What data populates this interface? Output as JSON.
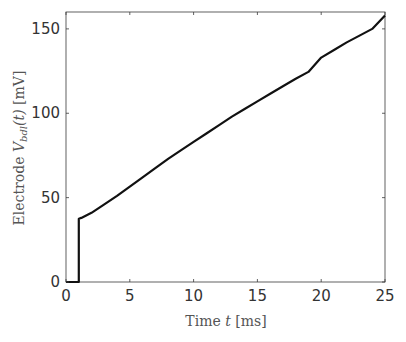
{
  "chart_data": {
    "type": "line",
    "title": "",
    "xlabel": "Time t [ms]",
    "xlabel_parts": {
      "prefix": "Time ",
      "var": "t",
      "suffix": " [ms]"
    },
    "ylabel": "Electrode V_bdl(t) [mV]",
    "ylabel_parts": {
      "prefix": "Electrode ",
      "var": "V",
      "sub": "bdl",
      "arg": "(t)",
      "suffix": " [mV]"
    },
    "xlim": [
      0,
      25
    ],
    "ylim": [
      0,
      160
    ],
    "xticks": [
      0,
      5,
      10,
      15,
      20,
      25
    ],
    "yticks": [
      0,
      50,
      100,
      150
    ],
    "xtick_labels": [
      "0",
      "5",
      "10",
      "15",
      "20",
      "25"
    ],
    "ytick_labels": [
      "0",
      "50",
      "100",
      "150"
    ],
    "grid": false,
    "legend": null,
    "series": [
      {
        "name": "V_bdl(t)",
        "color": "#111111",
        "x": [
          0,
          1,
          1,
          1.2,
          2,
          3,
          4,
          5,
          6,
          7,
          8,
          9,
          10,
          11,
          12,
          13,
          14,
          15,
          16,
          17,
          18,
          19,
          20,
          21,
          22,
          23,
          24,
          25
        ],
        "y": [
          0,
          0,
          37.5,
          38,
          41,
          46,
          51,
          56.5,
          62,
          67.5,
          73,
          78,
          83,
          88,
          93,
          98,
          102.5,
          107,
          111.5,
          116,
          120.5,
          124.5,
          133,
          137.5,
          142,
          146,
          150,
          158
        ]
      }
    ]
  }
}
